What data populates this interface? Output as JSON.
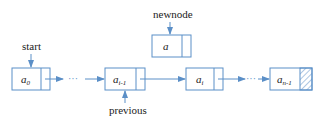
{
  "diagram": {
    "type": "linked-list-insertion",
    "accent_color": "#5b8fc7",
    "labels": {
      "start": "start",
      "newnode": "newnode",
      "previous": "previous",
      "ellipsis_1": "···",
      "ellipsis_2": "···"
    },
    "nodes": [
      {
        "id": "a0",
        "base": "a",
        "sub": "0",
        "null_pointer": false
      },
      {
        "id": "a_i-1",
        "base": "a",
        "sub": "i-1",
        "null_pointer": false
      },
      {
        "id": "a_i",
        "base": "a",
        "sub": "i",
        "null_pointer": false
      },
      {
        "id": "a_n-1",
        "base": "a",
        "sub": "n-1",
        "null_pointer": true
      }
    ],
    "new_node": {
      "id": "a",
      "base": "a",
      "sub": ""
    }
  }
}
